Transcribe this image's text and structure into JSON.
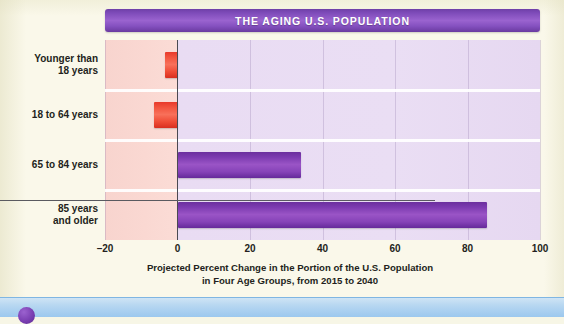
{
  "title": "THE AGING U.S. POPULATION",
  "caption": {
    "line1": "Projected Percent Change in the Portion of the U.S. Population",
    "line2": "in Four Age Groups, from 2015 to 2040"
  },
  "colors": {
    "title_banner": "#7f4cba",
    "negative_bar": "#ef4b35",
    "positive_bar": "#8643b8",
    "panel_negative": "#fad8d2",
    "panel_positive": "#e9dcf3",
    "page_background": "#faf8ea",
    "bottom_strip": "#a9cff0",
    "bullet": "#7a3fb2"
  },
  "chart_data": {
    "type": "bar",
    "orientation": "horizontal",
    "title": "THE AGING U.S. POPULATION",
    "xlabel": "Projected Percent Change in the Portion of the U.S. Population in Four Age Groups, from 2015 to 2040",
    "ylabel": "",
    "xlim": [
      -20,
      100
    ],
    "xticks": [
      -20,
      0,
      20,
      40,
      60,
      80,
      100
    ],
    "xticklabels": [
      "–20",
      "0",
      "20",
      "40",
      "60",
      "80",
      "100"
    ],
    "grid": true,
    "legend": false,
    "categories": [
      "Younger than 18 years",
      "18 to 64 years",
      "65 to 84 years",
      "85 years and older"
    ],
    "category_lines": [
      [
        "Younger than",
        "18 years"
      ],
      [
        "18 to 64 years"
      ],
      [
        "65 to 84 years"
      ],
      [
        "85 years",
        "and older"
      ]
    ],
    "values": [
      -3.5,
      -6.5,
      34,
      85.5
    ],
    "value_colors": [
      "#ef4b35",
      "#ef4b35",
      "#8643b8",
      "#8643b8"
    ]
  }
}
